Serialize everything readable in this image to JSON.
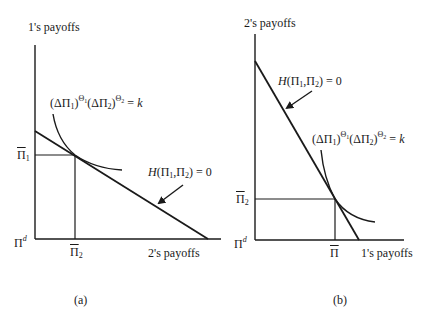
{
  "figure": {
    "panel_a": {
      "caption": "(a)",
      "y_axis_label": "1's payoffs",
      "x_axis_label": "2's payoffs",
      "origin_label": "Π",
      "origin_sup": "d",
      "y_tick": {
        "base": "Π",
        "sub": "1"
      },
      "x_tick": {
        "base": "Π",
        "sub": "2"
      },
      "curve_label": {
        "open1": "(ΔΠ",
        "sub1": "1",
        "close1": ")",
        "sup1": "Θ",
        "supsub1": "1",
        "open2": "(ΔΠ",
        "sub2": "2",
        "close2": ")",
        "sup2": "Θ",
        "supsub2": "2",
        "eq": " = ",
        "k": "k"
      },
      "frontier_label": {
        "H": "H",
        "args_open": "(Π",
        "sub1": "1",
        "mid": ",Π",
        "sub2": "2",
        "args_close": ") = 0"
      }
    },
    "panel_b": {
      "caption": "(b)",
      "y_axis_label": "2's payoffs",
      "x_axis_label": "1's payoffs",
      "origin_label": "Π",
      "origin_sup": "d",
      "y_tick": {
        "base": "Π",
        "sub": "2"
      },
      "x_tick": {
        "base": "Π",
        "sub": ""
      },
      "curve_label": {
        "open1": "(ΔΠ",
        "sub1": "1",
        "close1": ")",
        "sup1": "Θ",
        "supsub1": "1",
        "open2": "(ΔΠ",
        "sub2": "2",
        "close2": ")",
        "sup2": "Θ",
        "supsub2": "2",
        "eq": " = ",
        "k": "k"
      },
      "frontier_label": {
        "H": "H",
        "args_open": "(Π",
        "sub1": "1",
        "mid": ",Π",
        "sub2": "2",
        "args_close": ") = 0"
      }
    }
  },
  "colors": {
    "ink": "#1a1a1a",
    "background": "#ffffff"
  }
}
